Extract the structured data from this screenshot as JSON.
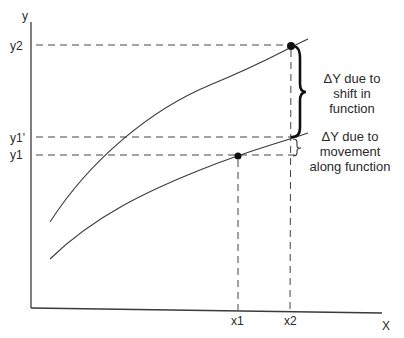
{
  "diagram": {
    "axes": {
      "y_label": "y",
      "x_label": "X"
    },
    "y_ticks": [
      {
        "label": "y2",
        "y": 46
      },
      {
        "label": "y1'",
        "y": 138
      },
      {
        "label": "y1",
        "y": 155
      }
    ],
    "x_ticks": [
      {
        "label": "x1",
        "x": 238
      },
      {
        "label": "x2",
        "x": 291
      }
    ],
    "curves": [
      {
        "name": "shifted-function",
        "description": "upper curve after shift in function"
      },
      {
        "name": "original-function",
        "description": "lower curve, original function"
      }
    ],
    "points": [
      {
        "name": "point-x1-y1",
        "x_label": "x1",
        "y_label": "y1"
      },
      {
        "name": "point-x2-y2",
        "x_label": "x2",
        "y_label": "y2"
      }
    ],
    "annotations": {
      "shift": {
        "line1": "ΔY due to",
        "line2": "shift in",
        "line3": "function"
      },
      "movement": {
        "line1": "ΔY due to",
        "line2": "movement",
        "line3": "along function"
      }
    }
  }
}
